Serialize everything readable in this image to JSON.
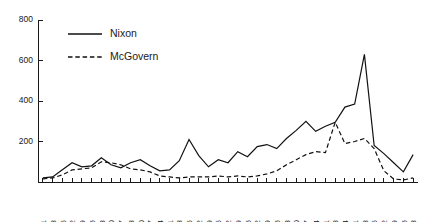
{
  "chart_data": {
    "type": "line",
    "title": "",
    "subtitle": "",
    "xlabel": "",
    "ylabel": "",
    "ylim": [
      0,
      800
    ],
    "yticks": [
      0,
      200,
      400,
      600,
      800
    ],
    "grid": false,
    "legend_position": "top-left",
    "categories": [
      "4-1",
      "4-8",
      "4-15",
      "4-22",
      "4-29",
      "5-6",
      "5-13",
      "5-20",
      "5-27",
      "6-3",
      "6-10",
      "6-17",
      "6-24",
      "7-1",
      "7-8",
      "7-15",
      "7-22",
      "7-29",
      "8-5",
      "8-12",
      "8-19",
      "8-26",
      "9-2",
      "9-9",
      "9-16",
      "9-23",
      "9-30",
      "10-7",
      "10-14",
      "10-21",
      "10-28",
      "11-4",
      "11-11",
      "11-18",
      "11-25",
      "12-2",
      "12-9",
      "12-16",
      "12-23"
    ],
    "series": [
      {
        "name": "Nixon",
        "style": "solid",
        "color": "#111111",
        "values": [
          20,
          25,
          60,
          95,
          75,
          80,
          120,
          85,
          70,
          95,
          110,
          80,
          55,
          60,
          105,
          210,
          130,
          75,
          110,
          95,
          150,
          125,
          175,
          185,
          165,
          215,
          255,
          300,
          250,
          275,
          295,
          370,
          385,
          630,
          180,
          140,
          95,
          50,
          135
        ]
      },
      {
        "name": "McGovern",
        "style": "dashed",
        "color": "#111111",
        "values": [
          15,
          20,
          35,
          60,
          65,
          70,
          100,
          95,
          85,
          65,
          60,
          50,
          30,
          25,
          20,
          25,
          25,
          25,
          30,
          25,
          30,
          25,
          30,
          40,
          55,
          85,
          110,
          135,
          150,
          145,
          295,
          190,
          200,
          215,
          165,
          55,
          15,
          10,
          20
        ]
      }
    ],
    "legend": [
      {
        "label": "Nixon",
        "style": "solid"
      },
      {
        "label": "McGovern",
        "style": "dashed"
      }
    ]
  }
}
